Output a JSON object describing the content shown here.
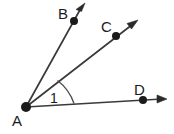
{
  "figure": {
    "type": "geometry-angle-diagram",
    "background_color": "#ffffff",
    "stroke_color": "#3a3a3a",
    "label_color": "#1b1b1b",
    "width": 174,
    "height": 134,
    "vertex": {
      "name": "A",
      "label": "A",
      "x": 26,
      "y": 107,
      "label_x": 12,
      "label_y": 126
    },
    "rays": [
      {
        "name": "ray-AB",
        "label": "B",
        "point_x": 74,
        "point_y": 21,
        "tip_x": 85,
        "tip_y": 3,
        "label_x": 58,
        "label_y": 19
      },
      {
        "name": "ray-AC",
        "label": "C",
        "point_x": 116,
        "point_y": 36,
        "tip_x": 138,
        "tip_y": 20,
        "label_x": 101,
        "label_y": 32
      },
      {
        "name": "ray-AD",
        "label": "D",
        "point_x": 143,
        "point_y": 100,
        "tip_x": 167,
        "tip_y": 99,
        "label_x": 134,
        "label_y": 95
      }
    ],
    "angle": {
      "name": "angle-1",
      "label": "1",
      "label_x": 50,
      "label_y": 103,
      "arc_radius": 48,
      "arc_path": "M 57.5 80.5 A 48 48 0 0 1 74 103.5",
      "between": "ray-AC and ray-AD"
    }
  }
}
